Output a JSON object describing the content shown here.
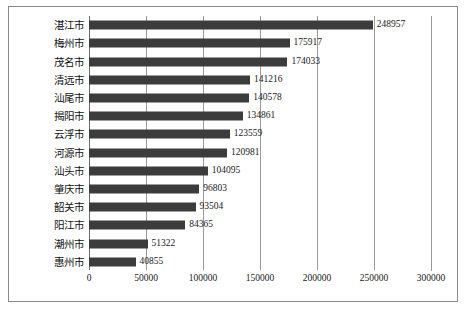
{
  "chart_data": {
    "type": "bar",
    "orientation": "horizontal",
    "title": "",
    "xlabel": "",
    "ylabel": "",
    "xlim": [
      0,
      300000
    ],
    "grid": true,
    "legend": "none",
    "tick_labels": [
      "0",
      "50000",
      "100000",
      "150000",
      "200000",
      "250000",
      "300000"
    ],
    "tick_values": [
      0,
      50000,
      100000,
      150000,
      200000,
      250000,
      300000
    ],
    "categories": [
      "湛江市",
      "梅州市",
      "茂名市",
      "清远市",
      "汕尾市",
      "揭阳市",
      "云浮市",
      "河源市",
      "汕头市",
      "肇庆市",
      "韶关市",
      "阳江市",
      "潮州市",
      "惠州市"
    ],
    "values": [
      248957,
      175917,
      174033,
      141216,
      140578,
      134861,
      123559,
      120981,
      104095,
      96803,
      93504,
      84365,
      51322,
      40855
    ],
    "value_labels": [
      "248957",
      "175917",
      "174033",
      "141216",
      "140578",
      "134861",
      "123559",
      "120981",
      "104095",
      "96803",
      "93504",
      "84365",
      "51322",
      "40855"
    ],
    "bar_color": "#3c3c3c",
    "gridline_color": "#9a9a9a",
    "frame_color": "#8a8a8a"
  },
  "caption": {
    "text": ""
  }
}
